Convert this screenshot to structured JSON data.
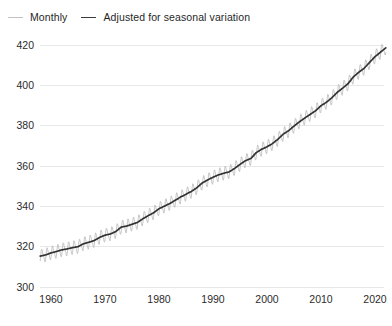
{
  "legend": {
    "position": "top-left",
    "items": [
      {
        "label": "Monthly",
        "color": "#bdbdbd",
        "icon": "line-swatch-icon"
      },
      {
        "label": "Adjusted for seasonal variation",
        "color": "#333333",
        "icon": "line-swatch-icon"
      }
    ]
  },
  "chart_data": {
    "type": "line",
    "title": "",
    "subtitle": "",
    "xlabel": "",
    "ylabel": "",
    "xlim": [
      1958,
      2022
    ],
    "ylim": [
      300,
      424
    ],
    "grid": true,
    "grid_axis": "y",
    "xticks": [
      1960,
      1970,
      1980,
      1990,
      2000,
      2010,
      2020
    ],
    "xticklabels": [
      "1960",
      "1970",
      "1980",
      "1990",
      "2000",
      "2010",
      "2020"
    ],
    "yticks": [
      300,
      320,
      340,
      360,
      380,
      400,
      420
    ],
    "yticklabels": [
      "300",
      "320",
      "340",
      "360",
      "380",
      "400",
      "420"
    ],
    "legend_position": "above-plot-left",
    "series": [
      {
        "name": "Monthly",
        "color": "#bdbdbd",
        "description": "Monthly mean CO2 concentration with seasonal oscillation (~6 ppm peak-to-peak, maximum in May, minimum in September)",
        "seasonal_amplitude_ppm": 3.0,
        "seasonal_peak_month": 5,
        "seasonal_trough_month": 9
      },
      {
        "name": "Adjusted for seasonal variation",
        "color": "#333333",
        "description": "Seasonally adjusted trend of the monthly mean CO2 concentration",
        "x": [
          1958,
          1959,
          1960,
          1961,
          1962,
          1963,
          1964,
          1965,
          1966,
          1967,
          1968,
          1969,
          1970,
          1971,
          1972,
          1973,
          1974,
          1975,
          1976,
          1977,
          1978,
          1979,
          1980,
          1981,
          1982,
          1983,
          1984,
          1985,
          1986,
          1987,
          1988,
          1989,
          1990,
          1991,
          1992,
          1993,
          1994,
          1995,
          1996,
          1997,
          1998,
          1999,
          2000,
          2001,
          2002,
          2003,
          2004,
          2005,
          2006,
          2007,
          2008,
          2009,
          2010,
          2011,
          2012,
          2013,
          2014,
          2015,
          2016,
          2017,
          2018,
          2019,
          2020,
          2021,
          2022
        ],
        "values": [
          315.3,
          315.9,
          316.9,
          317.6,
          318.4,
          318.9,
          319.5,
          320.0,
          321.4,
          322.2,
          323.0,
          324.6,
          325.7,
          326.3,
          327.5,
          329.7,
          330.2,
          331.1,
          332.0,
          333.8,
          335.4,
          336.8,
          338.8,
          340.1,
          341.4,
          343.0,
          344.6,
          346.0,
          347.4,
          349.2,
          351.6,
          353.1,
          354.4,
          355.6,
          356.4,
          357.1,
          358.8,
          360.8,
          362.6,
          363.7,
          366.6,
          368.3,
          369.5,
          371.1,
          373.2,
          375.8,
          377.5,
          379.8,
          381.9,
          383.8,
          385.6,
          387.4,
          389.9,
          391.6,
          393.8,
          396.5,
          398.6,
          400.8,
          404.2,
          406.5,
          408.5,
          411.4,
          414.2,
          416.4,
          418.6
        ]
      }
    ]
  }
}
